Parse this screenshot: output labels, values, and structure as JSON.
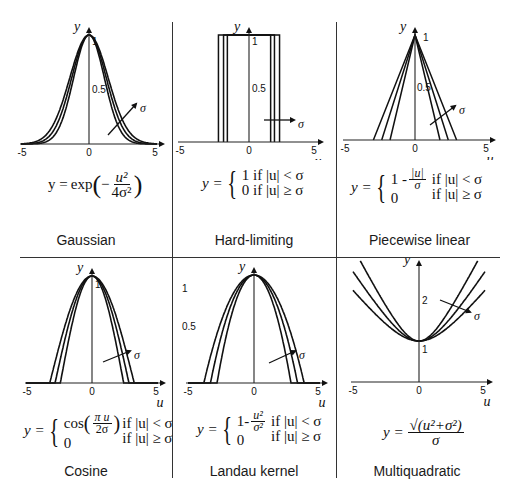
{
  "figure": {
    "grid": {
      "columns": 3,
      "rows": 2
    }
  },
  "panels": [
    {
      "id": "gaussian",
      "caption": "Gaussian",
      "equation": {
        "lhs": "y =",
        "func": "exp",
        "num": "u²",
        "den": "4σ²",
        "sign": "−"
      },
      "axes": {
        "x_label": "u",
        "y_label": "y",
        "x_ticks": [
          "-5",
          "0",
          "5"
        ],
        "y_ticks": [
          "0.5",
          "1"
        ]
      },
      "arrow_label": "σ"
    },
    {
      "id": "hard-limiting",
      "caption": "Hard-limiting",
      "equation": {
        "lhs": "y =",
        "case1": "1  if |u| < σ",
        "case2": "0  if |u| ≥ σ"
      },
      "axes": {
        "x_label": "u",
        "y_label": "y",
        "x_ticks": [
          "-5",
          "0",
          "5"
        ],
        "y_ticks": [
          "0.5",
          "1"
        ]
      },
      "arrow_label": "σ"
    },
    {
      "id": "piecewise-linear",
      "caption": "Piecewise linear",
      "equation": {
        "lhs": "y =",
        "case1_a": "1 -",
        "case1_num": "|u|",
        "case1_den": "σ",
        "case1_cond": "if |u| < σ",
        "case2_a": "0",
        "case2_cond": "if |u| ≥ σ"
      },
      "axes": {
        "x_label": "u",
        "y_label": "y",
        "x_ticks": [
          "-5",
          "0",
          "5"
        ],
        "y_ticks": [
          "0.5",
          "1"
        ]
      },
      "arrow_label": "σ"
    },
    {
      "id": "cosine",
      "caption": "Cosine",
      "equation": {
        "lhs": "y =",
        "case1_a": "cos",
        "case1_num": "π u",
        "case1_den": "2σ",
        "case1_cond": "if |u| < σ",
        "case2_a": "0",
        "case2_cond": "if |u| ≥ σ"
      },
      "axes": {
        "x_label": "u",
        "y_label": "y",
        "x_ticks": [
          "-5",
          "0",
          "5"
        ],
        "y_ticks": [
          "1"
        ]
      },
      "arrow_label": "σ"
    },
    {
      "id": "landau-kernel",
      "caption": "Landau kernel",
      "equation": {
        "lhs": "y =",
        "case1_a": "1-",
        "case1_num": "u²",
        "case1_den": "σ²",
        "case1_cond": "if |u| < σ",
        "case2_a": "0",
        "case2_cond": "if |u| ≥ σ"
      },
      "axes": {
        "x_label": "u",
        "y_label": "y",
        "x_ticks": [
          "-5",
          "0",
          "5"
        ],
        "y_ticks": [
          "1",
          "0.5"
        ]
      },
      "arrow_label": "σ"
    },
    {
      "id": "multiquadratic",
      "caption": "Multiquadratic",
      "equation": {
        "lhs": "y =",
        "num": "√(u²+σ²)",
        "den": "σ"
      },
      "axes": {
        "x_label": "u",
        "y_label": "y",
        "x_ticks": [
          "-5",
          "0",
          "5"
        ],
        "y_ticks": [
          "1",
          "2"
        ]
      },
      "arrow_label": "σ"
    }
  ],
  "chart_data": [
    {
      "type": "line",
      "title": "Gaussian",
      "xlabel": "u",
      "ylabel": "y",
      "xlim": [
        -5,
        5
      ],
      "ylim": [
        0,
        1
      ],
      "formula": "y = exp(-u^2/(4 sigma^2))",
      "series": [
        {
          "name": "sigma=0.8"
        },
        {
          "name": "sigma=0.9"
        },
        {
          "name": "sigma=1.0"
        }
      ]
    },
    {
      "type": "line",
      "title": "Hard-limiting",
      "xlabel": "u",
      "ylabel": "y",
      "xlim": [
        -5,
        5
      ],
      "ylim": [
        0,
        1
      ],
      "formula": "y = 1 if |u|<sigma, 0 otherwise",
      "series": [
        {
          "name": "sigma=1.7"
        },
        {
          "name": "sigma=2.0"
        },
        {
          "name": "sigma=2.4"
        }
      ]
    },
    {
      "type": "line",
      "title": "Piecewise linear",
      "xlabel": "u",
      "ylabel": "y",
      "xlim": [
        -5,
        5
      ],
      "ylim": [
        0,
        1
      ],
      "formula": "y = 1-|u|/sigma if |u|<sigma, 0 otherwise",
      "series": [
        {
          "name": "sigma=1.8"
        },
        {
          "name": "sigma=2.4"
        },
        {
          "name": "sigma=3.0"
        }
      ]
    },
    {
      "type": "line",
      "title": "Cosine",
      "xlabel": "u",
      "ylabel": "y",
      "xlim": [
        -5,
        5
      ],
      "ylim": [
        0,
        1
      ],
      "formula": "y = cos(pi u/(2 sigma)) if |u|<sigma, 0 otherwise",
      "series": [
        {
          "name": "sigma=2.4"
        },
        {
          "name": "sigma=2.8"
        },
        {
          "name": "sigma=3.2"
        }
      ]
    },
    {
      "type": "line",
      "title": "Landau kernel",
      "xlabel": "u",
      "ylabel": "y",
      "xlim": [
        -5,
        5
      ],
      "ylim": [
        0,
        1
      ],
      "formula": "y = 1-u^2/sigma^2 if |u|<sigma, 0 otherwise",
      "series": [
        {
          "name": "sigma=2.8"
        },
        {
          "name": "sigma=3.3"
        },
        {
          "name": "sigma=3.8"
        }
      ]
    },
    {
      "type": "line",
      "title": "Multiquadratic",
      "xlabel": "u",
      "ylabel": "y",
      "xlim": [
        -5,
        5
      ],
      "ylim": [
        0,
        3
      ],
      "formula": "y = sqrt(u^2+sigma^2)/sigma",
      "series": [
        {
          "name": "sigma=1.6"
        },
        {
          "name": "sigma=2.0"
        },
        {
          "name": "sigma=2.5"
        }
      ]
    }
  ]
}
